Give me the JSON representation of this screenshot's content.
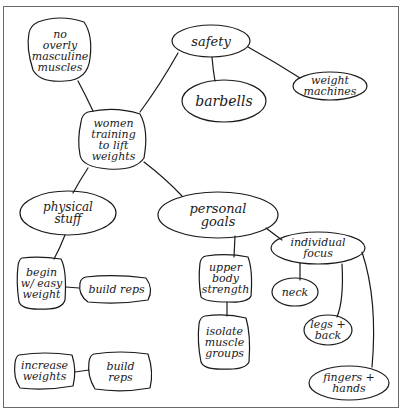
{
  "diagram": {
    "type": "concept-map",
    "style": "hand-drawn",
    "colors": {
      "ink": "#1a1a1a",
      "background": "#ffffff",
      "frame": "#6a6a6a"
    },
    "nodes": {
      "central": {
        "id": "central",
        "label": "women\ntraining\nto lift\nweights",
        "shape": "blob"
      },
      "no_masculine": {
        "id": "no_masculine",
        "label": "no\noverly\nmasculine\nmuscles",
        "shape": "blob"
      },
      "safety": {
        "id": "safety",
        "label": "safety",
        "shape": "ellipse"
      },
      "barbells": {
        "id": "barbells",
        "label": "barbells",
        "shape": "ellipse"
      },
      "weight_machines": {
        "id": "weight_machines",
        "label": "weight\nmachines",
        "shape": "ellipse"
      },
      "physical_stuff": {
        "id": "physical_stuff",
        "label": "physical\nstuff",
        "shape": "ellipse"
      },
      "personal_goals": {
        "id": "personal_goals",
        "label": "personal\ngoals",
        "shape": "ellipse"
      },
      "individual_focus": {
        "id": "individual_focus",
        "label": "individual\nfocus",
        "shape": "ellipse"
      },
      "begin_easy": {
        "id": "begin_easy",
        "label": "begin\nw/ easy\nweight",
        "shape": "rounded-rect"
      },
      "build_reps_1": {
        "id": "build_reps_1",
        "label": "build reps",
        "shape": "rounded-rect"
      },
      "upper_body": {
        "id": "upper_body",
        "label": "upper\nbody\nstrength",
        "shape": "rounded-rect"
      },
      "neck": {
        "id": "neck",
        "label": "neck",
        "shape": "ellipse"
      },
      "isolate_muscle": {
        "id": "isolate_muscle",
        "label": "isolate\nmuscle\ngroups",
        "shape": "rounded-rect"
      },
      "legs_back": {
        "id": "legs_back",
        "label": "legs +\nback",
        "shape": "ellipse"
      },
      "increase_weights": {
        "id": "increase_weights",
        "label": "increase\nweights",
        "shape": "rounded-rect"
      },
      "build_reps_2": {
        "id": "build_reps_2",
        "label": "build\nreps",
        "shape": "rounded-rect"
      },
      "fingers_hands": {
        "id": "fingers_hands",
        "label": "fingers +\nhands",
        "shape": "ellipse"
      }
    },
    "edges": [
      {
        "from": "central",
        "to": "no_masculine"
      },
      {
        "from": "central",
        "to": "safety"
      },
      {
        "from": "safety",
        "to": "barbells"
      },
      {
        "from": "safety",
        "to": "weight_machines"
      },
      {
        "from": "central",
        "to": "physical_stuff"
      },
      {
        "from": "central",
        "to": "personal_goals"
      },
      {
        "from": "physical_stuff",
        "to": "begin_easy"
      },
      {
        "from": "begin_easy",
        "to": "build_reps_1"
      },
      {
        "from": "increase_weights",
        "to": "build_reps_2"
      },
      {
        "from": "personal_goals",
        "to": "upper_body"
      },
      {
        "from": "upper_body",
        "to": "isolate_muscle"
      },
      {
        "from": "personal_goals",
        "to": "individual_focus"
      },
      {
        "from": "individual_focus",
        "to": "neck"
      },
      {
        "from": "individual_focus",
        "to": "legs_back"
      },
      {
        "from": "individual_focus",
        "to": "fingers_hands"
      }
    ]
  }
}
